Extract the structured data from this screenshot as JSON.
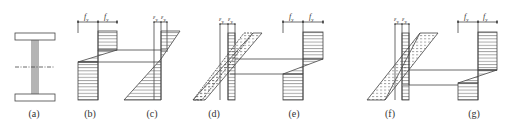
{
  "figure": {
    "panels": [
      {
        "id": "a",
        "label": "(a)",
        "content": "I-beam cross-section with neutral axis"
      },
      {
        "id": "b",
        "label": "(b)",
        "content": "Stress diagram, fully plastic",
        "dim_labels": [
          "f",
          "f"
        ],
        "dim_sub": [
          "y",
          "y"
        ]
      },
      {
        "id": "c",
        "label": "(c)",
        "content": "Strain diagram",
        "dim_labels": [
          "ε",
          "ε"
        ],
        "dim_sub": [
          "y",
          "y"
        ]
      },
      {
        "id": "d",
        "label": "(d)",
        "content": "Strain diagram with hatched bands",
        "dim_labels": [
          "ε",
          "ε"
        ],
        "dim_sub": [
          "y",
          "y"
        ]
      },
      {
        "id": "e",
        "label": "(e)",
        "content": "Stress diagram",
        "dim_labels": [
          "f",
          "f"
        ],
        "dim_sub": [
          "y",
          "y"
        ]
      },
      {
        "id": "f",
        "label": "(f)",
        "content": "Strain diagram with hatched bands",
        "dim_labels": [
          "ε",
          "ε"
        ],
        "dim_sub": [
          "y",
          "y"
        ]
      },
      {
        "id": "g",
        "label": "(g)",
        "content": "Stress diagram",
        "dim_labels": [
          "f",
          "f"
        ],
        "dim_sub": [
          "y",
          "y"
        ]
      }
    ]
  },
  "colors": {
    "line": "#444444",
    "hatch": "#555555",
    "text": "#333333",
    "background": "#ffffff"
  }
}
